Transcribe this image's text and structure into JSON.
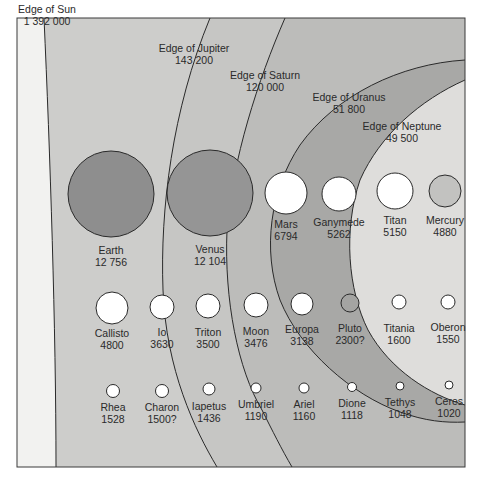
{
  "diagram": {
    "frame": {
      "x": 17,
      "y": 18,
      "right": 465,
      "bottom": 467
    },
    "colors": {
      "outside": "#ffffff",
      "sun_region": "#f2f2f0",
      "jupiter_region": "#cdcdcb",
      "saturn_region": "#bdbdbb",
      "uranus_region": "#a9a9a7",
      "neptune_region": "#dedddb",
      "line": "#2a2a2a",
      "earth": "#8e8e8e",
      "venus": "#959595",
      "mercury": "#c2c2c0",
      "pluto": "#a4a4a2",
      "white_body": "#ffffff"
    },
    "edges": [
      {
        "id": "sun",
        "label": "Edge of Sun",
        "value": "1 392 000",
        "lx": 47,
        "ly": 13
      },
      {
        "id": "jupiter",
        "label": "Edge of Jupiter",
        "value": "143 200",
        "lx": 194,
        "ly": 52
      },
      {
        "id": "saturn",
        "label": "Edge of Saturn",
        "value": "120 000",
        "lx": 265,
        "ly": 79
      },
      {
        "id": "uranus",
        "label": "Edge of Uranus",
        "value": "51 800",
        "lx": 349,
        "ly": 101
      },
      {
        "id": "neptune",
        "label": "Edge of Neptune",
        "value": "49 500",
        "lx": 402,
        "ly": 130
      }
    ],
    "bodies": [
      {
        "name": "Earth",
        "diameter": "12 756",
        "cx": 111,
        "cy": 194,
        "r": 43,
        "fill": "earth",
        "ly": 254
      },
      {
        "name": "Venus",
        "diameter": "12 104",
        "cx": 210,
        "cy": 193,
        "r": 43,
        "fill": "venus",
        "ly": 253
      },
      {
        "name": "Mars",
        "diameter": "6794",
        "cx": 286,
        "cy": 193,
        "r": 21,
        "fill": "white_body",
        "ly": 228
      },
      {
        "name": "Ganymede",
        "diameter": "5262",
        "cx": 339,
        "cy": 194,
        "r": 17,
        "fill": "white_body",
        "ly": 226
      },
      {
        "name": "Titan",
        "diameter": "5150",
        "cx": 395,
        "cy": 191,
        "r": 18,
        "fill": "white_body",
        "ly": 224
      },
      {
        "name": "Mercury",
        "diameter": "4880",
        "cx": 445,
        "cy": 191,
        "r": 16,
        "fill": "mercury",
        "ly": 224
      },
      {
        "name": "Callisto",
        "diameter": "4800",
        "cx": 112,
        "cy": 308,
        "r": 16,
        "fill": "white_body",
        "ly": 337
      },
      {
        "name": "Io",
        "diameter": "3630",
        "cx": 162,
        "cy": 307,
        "r": 12,
        "fill": "white_body",
        "ly": 336
      },
      {
        "name": "Triton",
        "diameter": "3500",
        "cx": 208,
        "cy": 306,
        "r": 12,
        "fill": "white_body",
        "ly": 336
      },
      {
        "name": "Moon",
        "diameter": "3476",
        "cx": 256,
        "cy": 305,
        "r": 12,
        "fill": "white_body",
        "ly": 335
      },
      {
        "name": "Europa",
        "diameter": "3138",
        "cx": 302,
        "cy": 304,
        "r": 11,
        "fill": "white_body",
        "ly": 333
      },
      {
        "name": "Pluto",
        "diameter": "2300?",
        "cx": 350,
        "cy": 303,
        "r": 9,
        "fill": "pluto",
        "ly": 332
      },
      {
        "name": "Titania",
        "diameter": "1600",
        "cx": 399,
        "cy": 302,
        "r": 7,
        "fill": "white_body",
        "ly": 332
      },
      {
        "name": "Oberon",
        "diameter": "1550",
        "cx": 448,
        "cy": 302,
        "r": 7,
        "fill": "white_body",
        "ly": 331
      },
      {
        "name": "Rhea",
        "diameter": "1528",
        "cx": 113,
        "cy": 391,
        "r": 6.5,
        "fill": "white_body",
        "ly": 411
      },
      {
        "name": "Charon",
        "diameter": "1500?",
        "cx": 162,
        "cy": 391,
        "r": 6.5,
        "fill": "white_body",
        "ly": 411
      },
      {
        "name": "Iapetus",
        "diameter": "1436",
        "cx": 209,
        "cy": 389,
        "r": 6,
        "fill": "white_body",
        "ly": 410
      },
      {
        "name": "Umbriel",
        "diameter": "1190",
        "cx": 256,
        "cy": 388,
        "r": 5,
        "fill": "white_body",
        "ly": 408
      },
      {
        "name": "Ariel",
        "diameter": "1160",
        "cx": 304,
        "cy": 388,
        "r": 5,
        "fill": "white_body",
        "ly": 408
      },
      {
        "name": "Dione",
        "diameter": "1118",
        "cx": 352,
        "cy": 387,
        "r": 4.5,
        "fill": "white_body",
        "ly": 407
      },
      {
        "name": "Tethys",
        "diameter": "1048",
        "cx": 400,
        "cy": 386,
        "r": 4,
        "fill": "white_body",
        "ly": 406
      },
      {
        "name": "Ceres",
        "diameter": "1020",
        "cx": 449,
        "cy": 385,
        "r": 4,
        "fill": "white_body",
        "ly": 405
      }
    ]
  }
}
